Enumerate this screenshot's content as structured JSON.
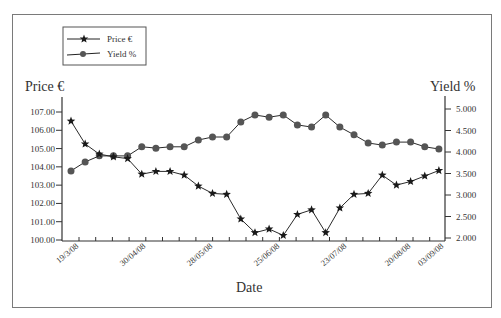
{
  "chart_data": {
    "type": "line",
    "title": "",
    "xlabel": "Date",
    "ylabel": "Price €",
    "y2label": "Yield %",
    "legend": {
      "position": "top-left",
      "entries": [
        "Price €",
        "Yield %"
      ]
    },
    "x_tick_labels": [
      "19/3/08",
      "30/04/08",
      "28/05/08",
      "25/06/08",
      "23/07/08",
      "20/08/08",
      "03/09/08"
    ],
    "yaxis_left": {
      "min": 100.0,
      "max": 107.0,
      "ticks": [
        "100.00",
        "101.00",
        "102.00",
        "103.00",
        "104.00",
        "105.00",
        "106.00",
        "107.00"
      ]
    },
    "yaxis_right": {
      "min": 2.0,
      "max": 5.0,
      "ticks": [
        "2.000",
        "2.500",
        "3.000",
        "3.500",
        "4.000",
        "4.500",
        "5.000"
      ]
    },
    "grid": false,
    "x": [
      1,
      2,
      3,
      4,
      5,
      6,
      7,
      8,
      9,
      10,
      11,
      12,
      13,
      14,
      15,
      16,
      17,
      18,
      19,
      20,
      21,
      22,
      23,
      24,
      25,
      26,
      27
    ],
    "series": [
      {
        "name": "Price €",
        "axis": "left",
        "marker": "star",
        "values": [
          106.5,
          105.25,
          104.7,
          104.55,
          104.45,
          103.6,
          103.75,
          103.75,
          103.55,
          102.95,
          102.55,
          102.5,
          101.15,
          100.4,
          100.6,
          100.25,
          101.4,
          101.65,
          100.4,
          101.75,
          102.5,
          102.55,
          103.55,
          103.0,
          103.2,
          103.5,
          103.8
        ]
      },
      {
        "name": "Yield %",
        "axis": "right",
        "marker": "circle",
        "values": [
          3.56,
          3.77,
          3.91,
          3.91,
          3.91,
          4.12,
          4.09,
          4.12,
          4.12,
          4.28,
          4.35,
          4.35,
          4.7,
          4.86,
          4.81,
          4.86,
          4.63,
          4.58,
          4.86,
          4.58,
          4.4,
          4.21,
          4.16,
          4.23,
          4.23,
          4.12,
          4.07
        ]
      }
    ]
  },
  "labels": {
    "left_axis_title": "Price €",
    "right_axis_title": "Yield %",
    "x_axis_title": "Date",
    "legend_price": "Price €",
    "legend_yield": "Yield %"
  },
  "colors": {
    "line": "#2a2a2a",
    "marker_circle": "#555555",
    "marker_star": "#1a1a1a",
    "frame": "#7a7a7a"
  }
}
